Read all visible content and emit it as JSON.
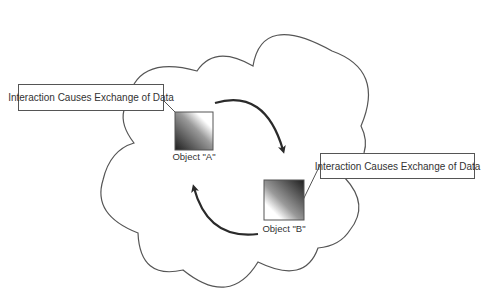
{
  "diagram": {
    "colors": {
      "outline": "#555555",
      "arrow": "#2a2a2a",
      "gradient_dark": "#222222",
      "gradient_light": "#ffffff",
      "background": "#ffffff"
    },
    "cloud": {
      "label": ""
    },
    "callouts": [
      {
        "id": "callout-a",
        "text": "Interaction Causes Exchange of Data"
      },
      {
        "id": "callout-b",
        "text": "Interaction Causes Exchange of Data"
      }
    ],
    "objects": [
      {
        "id": "object-a",
        "label": "Object \"A\""
      },
      {
        "id": "object-b",
        "label": "Object \"B\""
      }
    ],
    "arrows": [
      {
        "id": "arrow-a-to-b",
        "direction": "A to B"
      },
      {
        "id": "arrow-b-to-a",
        "direction": "B to A"
      }
    ]
  }
}
